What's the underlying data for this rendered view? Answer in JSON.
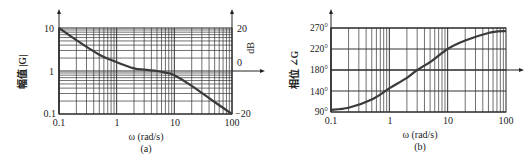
{
  "chart_data": [
    {
      "id": "a",
      "type": "line",
      "caption": "(a)",
      "title": "",
      "xlabel": "ω (rad/s)",
      "ylabel": "幅值 |G|",
      "y2label": "dB",
      "xscale": "log",
      "yscale": "log",
      "xlim": [
        0.1,
        100
      ],
      "ylim": [
        0.1,
        10
      ],
      "x_ticks": [
        "0.1",
        "1",
        "10",
        "100"
      ],
      "y_ticks": [
        "0.1",
        "1",
        "10"
      ],
      "y2_ticks": [
        "−20",
        "0",
        "20"
      ],
      "grid": true,
      "series": [
        {
          "name": "|G|",
          "x": [
            0.1,
            0.2,
            0.5,
            1,
            2,
            3,
            5,
            7,
            10,
            20,
            50,
            100
          ],
          "values": [
            10,
            5.2,
            2.4,
            1.6,
            1.15,
            1.07,
            1.0,
            0.92,
            0.8,
            0.45,
            0.19,
            0.1
          ]
        }
      ]
    },
    {
      "id": "b",
      "type": "line",
      "caption": "(b)",
      "title": "",
      "xlabel": "ω (rad/s)",
      "ylabel": "相位 ∠G",
      "xscale": "log",
      "xlim": [
        0.1,
        100
      ],
      "ylim": [
        90,
        270
      ],
      "x_ticks": [
        "0.1",
        "1",
        "10",
        "100"
      ],
      "y_ticks": [
        "90°",
        "140°",
        "180°",
        "220°",
        "270°"
      ],
      "grid": true,
      "series": [
        {
          "name": "∠G",
          "x": [
            0.1,
            0.2,
            0.5,
            1,
            2,
            3,
            5,
            10,
            20,
            50,
            100
          ],
          "values": [
            95,
            100,
            120,
            145,
            165,
            180,
            195,
            220,
            240,
            258,
            263
          ]
        }
      ]
    }
  ],
  "labels": {
    "a": {
      "ylabel": "幅值 |G|",
      "y2label": "dB",
      "xlabel": "ω (rad/s)",
      "caption": "(a)",
      "x_ticks": [
        "0.1",
        "1",
        "10",
        "100"
      ],
      "y_ticks": [
        "10",
        "1",
        "0.1"
      ],
      "y2_ticks": [
        "20",
        "0",
        "−20"
      ]
    },
    "b": {
      "ylabel": "相位 ∠G",
      "xlabel": "ω (rad/s)",
      "caption": "(b)",
      "x_ticks": [
        "0.1",
        "1",
        "10",
        "100"
      ],
      "y_ticks": [
        "270°",
        "220°",
        "180°",
        "140°",
        "90°"
      ]
    }
  },
  "colors": {
    "grid": "#333333",
    "curve": "#3a3a3a",
    "axis": "#222222"
  }
}
